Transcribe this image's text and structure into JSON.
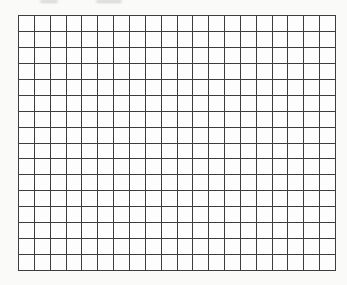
{
  "page": {
    "background_color": "#fafaf9"
  },
  "grid": {
    "columns": 20,
    "rows": 16,
    "cell_size_px": 16,
    "line_color": "#3d3d3d",
    "cell_fill_color": "#fdfdfd"
  }
}
